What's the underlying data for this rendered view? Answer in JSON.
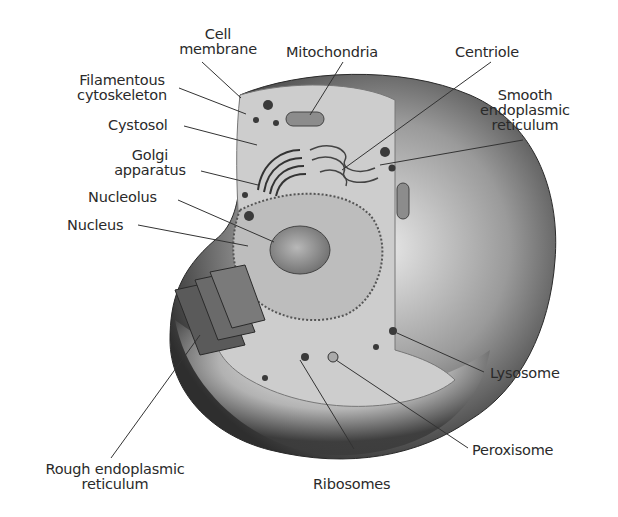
{
  "diagram": {
    "labels": {
      "cell_membrane": [
        "Cell",
        "membrane"
      ],
      "mitochondria": [
        "Mitochondria"
      ],
      "centriole": [
        "Centriole"
      ],
      "smooth_er": [
        "Smooth",
        "endoplasmic",
        "reticulum"
      ],
      "filamentous_cytoskeleton": [
        "Filamentous",
        "cytoskeleton"
      ],
      "cystosol": [
        "Cystosol"
      ],
      "golgi": [
        "Golgi",
        "apparatus"
      ],
      "nucleolus": [
        "Nucleolus"
      ],
      "nucleus": [
        "Nucleus"
      ],
      "lysosome": [
        "Lysosome"
      ],
      "peroxisome": [
        "Peroxisome"
      ],
      "rough_er": [
        "Rough endoplasmic",
        "reticulum"
      ],
      "ribosomes": [
        "Ribosomes"
      ]
    },
    "colors": {
      "outer_dark": "#3a3a3a",
      "outer_mid": "#8a8a8a",
      "cytoplasm": "#cfcfcf",
      "nucleus": "#9a9a9a",
      "leader": "#333333",
      "text": "#2a2a2a"
    }
  }
}
